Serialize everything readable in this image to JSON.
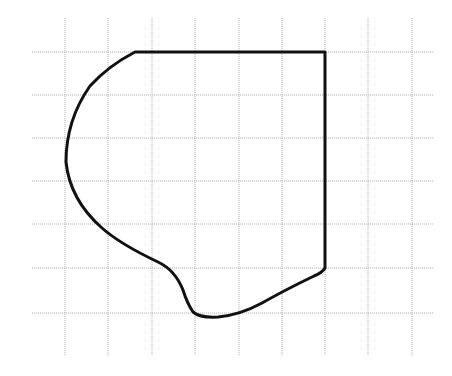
{
  "diagram": {
    "type": "figure-on-grid",
    "grid": {
      "line_color": "#b8b8b8",
      "vertical_x": [
        65,
        108,
        152,
        195,
        239,
        282,
        325,
        368,
        412
      ],
      "horizontal_y": [
        52,
        95,
        138,
        181,
        224,
        268,
        313
      ],
      "extent": {
        "left": 32,
        "right": 434,
        "top": 18,
        "bottom": 356
      },
      "cell_size": 43.4
    },
    "shape": {
      "stroke_color": "#111111",
      "path": "M 135 52 L 325 52 L 325 268 Q 322 273 314 276 Q 285 290 262 303 Q 240 315 218 317 Q 200 318 193 312 Q 187 303 183 290 Q 175 270 158 262 Q 120 244 102 228 Q 70 200 66 162 Q 66 120 90 86 Q 108 66 135 52 Z"
    }
  }
}
